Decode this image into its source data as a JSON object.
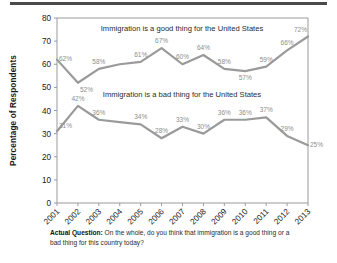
{
  "decor": {
    "top_rule_color": "#4a4a4a"
  },
  "caption": {
    "lead": "Actual Question:",
    "body": " On the whole, do you think that immigration is a good thing or a bad thing for this country today?"
  },
  "chart_data": {
    "type": "line",
    "title": "",
    "xlabel": "",
    "ylabel": "Percentage of Respondents",
    "ylim": [
      0,
      80
    ],
    "ytick_labels": [
      "0",
      "10",
      "20",
      "30",
      "40",
      "50",
      "60",
      "70",
      "80"
    ],
    "ytick_values": [
      0,
      10,
      20,
      30,
      40,
      50,
      60,
      70,
      80
    ],
    "grid": false,
    "legend_position": "inline-annotation",
    "categories": [
      "2001",
      "2002",
      "2003",
      "2004",
      "2005",
      "2006",
      "2007",
      "2008",
      "2009",
      "2010",
      "2011",
      "2012",
      "2013"
    ],
    "series": [
      {
        "name": "Immigration is a good thing for the United States",
        "color": "#9a9a9a",
        "values": [
          62,
          52,
          58,
          60,
          61,
          67,
          60,
          64,
          58,
          57,
          59,
          66,
          72
        ],
        "value_labels": [
          "62%",
          "52%",
          "58%",
          "",
          "61%",
          "67%",
          "60%",
          "64%",
          "58%",
          "57%",
          "59%",
          "66%",
          "72%"
        ]
      },
      {
        "name": "Immigration is a bad thing for the United States",
        "color": "#9a9a9a",
        "values": [
          31,
          42,
          36,
          35,
          34,
          28,
          33,
          30,
          36,
          36,
          37,
          29,
          25
        ],
        "value_labels": [
          "31%",
          "42%",
          "36%",
          "",
          "34%",
          "28%",
          "33%",
          "30%",
          "36%",
          "36%",
          "37%",
          "29%",
          "25%"
        ]
      }
    ],
    "annotations": [
      {
        "text": "Immigration is a good thing for the United States",
        "x": 182,
        "y": 31
      },
      {
        "text": "Immigration is a bad thing for the United States",
        "x": 182,
        "y": 97
      }
    ]
  }
}
